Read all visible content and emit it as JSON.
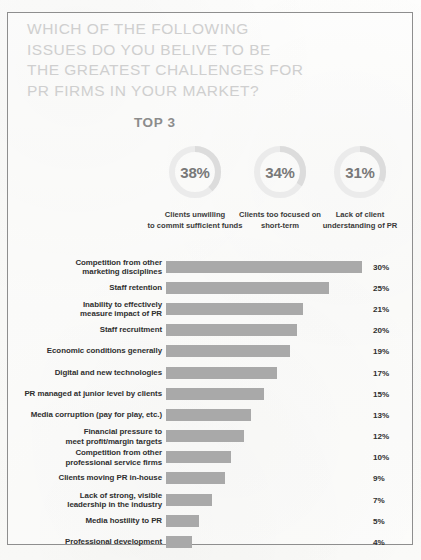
{
  "headline": {
    "lines": [
      "WHICH OF THE FOLLOWING",
      "ISSUES DO YOU BELIVE TO BE",
      "THE GREATEST CHALLENGES FOR",
      "PR FIRMS IN YOUR MARKET?"
    ],
    "color": "#cfcfcf"
  },
  "top3": {
    "label": "TOP 3",
    "donuts": [
      {
        "value": "38%",
        "percent": 38,
        "caption_lines": [
          "Clients unwilling",
          "to commit sufficient funds"
        ]
      },
      {
        "value": "34%",
        "percent": 34,
        "caption_lines": [
          "Clients too focused on",
          "short-term"
        ]
      },
      {
        "value": "31%",
        "percent": 31,
        "caption_lines": [
          "Lack of client",
          "understanding of PR"
        ]
      }
    ]
  },
  "colors": {
    "bar": "#a9a9a9",
    "donut_track": "#ebebeb",
    "donut_arc": "#dcdcdc",
    "frame": "#8e8e8e",
    "text": "#2f2f2f"
  },
  "chart_data": {
    "type": "bar",
    "xlabel": "",
    "ylabel": "",
    "xlim": [
      0,
      30
    ],
    "grid": false,
    "legend": "none",
    "orientation": "horizontal",
    "categories": [
      "Competition from other marketing disciplines",
      "Staff retention",
      "Inability to effectively measure impact of PR",
      "Staff recruitment",
      "Economic conditions generally",
      "Digital and new technologies",
      "PR managed at junior level by clients",
      "Media corruption (pay for play, etc.)",
      "Financial pressure to meet profit/margin targets",
      "Competition from other professional service firms",
      "Clients moving PR in-house",
      "Lack of strong, visible leadership in the industry",
      "Media hostility to PR",
      "Professional development"
    ],
    "values": [
      30,
      25,
      21,
      20,
      19,
      17,
      15,
      13,
      12,
      10,
      9,
      7,
      5,
      4
    ],
    "data_labels": [
      "30%",
      "25%",
      "21%",
      "20%",
      "19%",
      "17%",
      "15%",
      "13%",
      "12%",
      "10%",
      "9%",
      "7%",
      "5%",
      "4%"
    ]
  },
  "rows": [
    {
      "label_lines": [
        "Competition from other",
        "marketing disciplines"
      ],
      "value": 30,
      "pct": "30%"
    },
    {
      "label_lines": [
        "Staff retention"
      ],
      "value": 25,
      "pct": "25%"
    },
    {
      "label_lines": [
        "Inability to effectively",
        "measure impact of PR"
      ],
      "value": 21,
      "pct": "21%"
    },
    {
      "label_lines": [
        "Staff recruitment"
      ],
      "value": 20,
      "pct": "20%"
    },
    {
      "label_lines": [
        "Economic conditions generally"
      ],
      "value": 19,
      "pct": "19%"
    },
    {
      "label_lines": [
        "Digital and new technologies"
      ],
      "value": 17,
      "pct": "17%"
    },
    {
      "label_lines": [
        "PR managed at junior level by clients"
      ],
      "value": 15,
      "pct": "15%"
    },
    {
      "label_lines": [
        "Media corruption (pay for play, etc.)"
      ],
      "value": 13,
      "pct": "13%"
    },
    {
      "label_lines": [
        "Financial pressure to",
        "meet profit/margin targets"
      ],
      "value": 12,
      "pct": "12%"
    },
    {
      "label_lines": [
        "Competition from other",
        "professional service firms"
      ],
      "value": 10,
      "pct": "10%"
    },
    {
      "label_lines": [
        "Clients moving PR in-house"
      ],
      "value": 9,
      "pct": "9%"
    },
    {
      "label_lines": [
        "Lack of strong, visible",
        "leadership in the industry"
      ],
      "value": 7,
      "pct": "7%"
    },
    {
      "label_lines": [
        "Media hostility to PR"
      ],
      "value": 5,
      "pct": "5%"
    },
    {
      "label_lines": [
        "Professional development"
      ],
      "value": 4,
      "pct": "4%"
    }
  ]
}
